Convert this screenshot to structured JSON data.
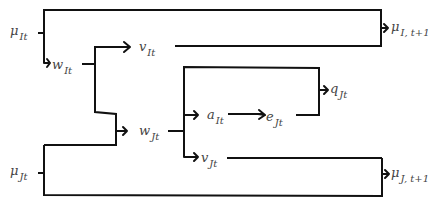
{
  "diagram": {
    "nodes": {
      "mu_It": {
        "base": "μ",
        "sub": "It"
      },
      "w_It": {
        "base": "w",
        "sub": "It"
      },
      "v_It": {
        "base": "v",
        "sub": "It"
      },
      "mu_It1": {
        "base": "μ",
        "sub": "I, t+1"
      },
      "w_Jt": {
        "base": "w",
        "sub": "Jt"
      },
      "a_It": {
        "base": "a",
        "sub": "It"
      },
      "e_Jt": {
        "base": "e",
        "sub": "Jt"
      },
      "q_Jt": {
        "base": "q",
        "sub": "Jt"
      },
      "v_Jt": {
        "base": "v",
        "sub": "Jt"
      },
      "mu_Jt": {
        "base": "μ",
        "sub": "Jt"
      },
      "mu_Jt1": {
        "base": "μ",
        "sub": "J, t+1"
      }
    },
    "edges": [
      {
        "from": "mu_It",
        "to": "mu_It1"
      },
      {
        "from": "mu_It",
        "to": "w_It"
      },
      {
        "from": "w_It",
        "to": "v_It"
      },
      {
        "from": "w_It",
        "to": "w_Jt"
      },
      {
        "from": "mu_Jt",
        "to": "w_Jt"
      },
      {
        "from": "v_It",
        "to": "mu_It1"
      },
      {
        "from": "w_Jt",
        "to": "a_It"
      },
      {
        "from": "w_Jt",
        "to": "v_Jt"
      },
      {
        "from": "w_Jt",
        "to": "q_Jt"
      },
      {
        "from": "a_It",
        "to": "e_Jt"
      },
      {
        "from": "e_Jt",
        "to": "q_Jt"
      },
      {
        "from": "mu_Jt",
        "to": "mu_Jt1"
      },
      {
        "from": "v_Jt",
        "to": "mu_Jt1"
      }
    ]
  }
}
